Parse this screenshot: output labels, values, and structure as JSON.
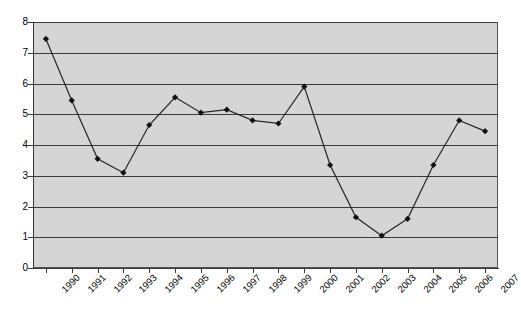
{
  "chart_data": {
    "type": "line",
    "title": "",
    "subtitle": "",
    "xlabel": "",
    "ylabel": "",
    "categories": [
      "1990",
      "1991",
      "1992",
      "1993",
      "1994",
      "1995",
      "1996",
      "1997",
      "1998",
      "1999",
      "2000",
      "2001",
      "2002",
      "2003",
      "2004",
      "2005",
      "2006",
      "2007"
    ],
    "values": [
      7.45,
      5.45,
      3.55,
      3.1,
      4.65,
      5.55,
      5.05,
      5.15,
      4.8,
      4.7,
      5.9,
      3.35,
      1.65,
      1.05,
      1.6,
      3.35,
      4.8,
      4.45
    ],
    "ylim": [
      0,
      8
    ],
    "ytick_labels": [
      "0",
      "1",
      "2",
      "3",
      "4",
      "5",
      "6",
      "7",
      "8"
    ],
    "grid": true,
    "legend": false,
    "legend_position": "none",
    "marker": "diamond",
    "colors": {
      "plot_background": "#d5d5d5",
      "gridline": "#3a3a3a",
      "axis": "#3a3a3a",
      "line": "#262626",
      "marker": "#111111",
      "page_background": "#ffffff",
      "tick_label": "#000000"
    }
  }
}
